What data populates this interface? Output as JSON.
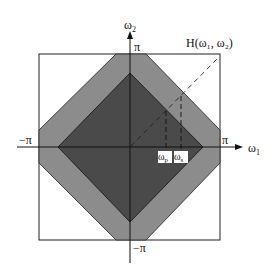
{
  "figure": {
    "title": "H(ω₁, ω₂)",
    "axes": {
      "x_label": "ω",
      "x_sub": "1",
      "y_label": "ω",
      "y_sub": "2",
      "x_pos_tick": "π",
      "x_neg_tick": "−π",
      "y_pos_tick": "π",
      "y_neg_tick": "−π"
    },
    "markers": {
      "passband_label": "ω",
      "passband_sub": "p",
      "stopband_label": "ω",
      "stopband_sub": "s"
    },
    "regions": {
      "passband_color": "#4a4a4a",
      "transition_color": "#8c8c8c",
      "stopband_color": "#ffffff"
    }
  }
}
